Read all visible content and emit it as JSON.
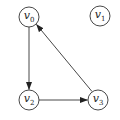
{
  "graph": {
    "type": "directed",
    "nodes": [
      {
        "id": "v0",
        "label": "v",
        "sub": "0",
        "x": 29,
        "y": 17
      },
      {
        "id": "v1",
        "label": "v",
        "sub": "1",
        "x": 100,
        "y": 16
      },
      {
        "id": "v2",
        "label": "v",
        "sub": "2",
        "x": 29,
        "y": 100
      },
      {
        "id": "v3",
        "label": "v",
        "sub": "3",
        "x": 98,
        "y": 100
      }
    ],
    "edges": [
      {
        "from": "v0",
        "to": "v2"
      },
      {
        "from": "v2",
        "to": "v3"
      },
      {
        "from": "v3",
        "to": "v0"
      }
    ],
    "node_radius": 10,
    "stroke_color": "#333333"
  }
}
